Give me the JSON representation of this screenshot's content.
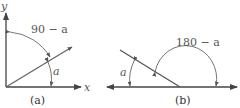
{
  "panels": [
    {
      "id": "a",
      "caption": "(a)",
      "axis_labels": {
        "x": "x",
        "y": "y"
      },
      "angle_labels": {
        "upper": "90 − a",
        "lower": "a"
      }
    },
    {
      "id": "b",
      "caption": "(b)",
      "angle_labels": {
        "upper": "180 − a",
        "lower": "a"
      }
    }
  ],
  "colors": {
    "line": "#555555",
    "text": "#555555"
  }
}
